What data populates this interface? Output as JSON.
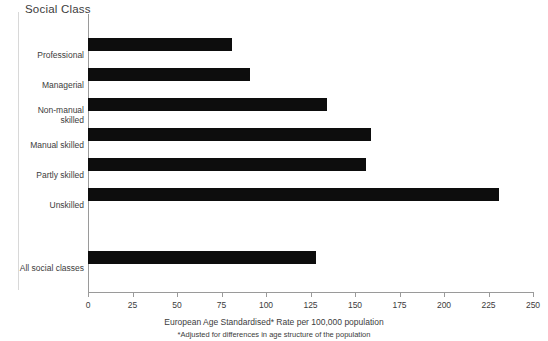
{
  "chart_data": {
    "type": "bar",
    "orientation": "horizontal",
    "title": "Social Class",
    "categories": [
      "Professional",
      "Managerial",
      "Non-manual\nskilled",
      "Manual skilled",
      "Partly skilled",
      "Unskilled",
      "All social classes"
    ],
    "values": [
      81,
      91,
      134,
      159,
      156,
      231,
      128
    ],
    "xlabel": "European Age Standardised* Rate per 100,000 population",
    "ylabel": "Social Class",
    "xlim": [
      0,
      250
    ],
    "xticks": [
      0,
      25,
      50,
      75,
      100,
      125,
      150,
      175,
      200,
      225,
      250
    ],
    "xtick_labels": [
      "0",
      "25",
      "50",
      "75",
      "100",
      "125",
      "150",
      "175",
      "200",
      "225",
      "250"
    ],
    "grid": false,
    "legend": false,
    "bar_color": "#0d0d0d",
    "axis_color": "#9a9a9a",
    "text_color": "#3c3c3c",
    "annotations": [
      "*Adjusted for differences in age structure of the population"
    ]
  },
  "footer": {
    "axis_caption": "European Age Standardised* Rate per 100,000 population",
    "footnote": "*Adjusted for differences in age structure of the population"
  }
}
